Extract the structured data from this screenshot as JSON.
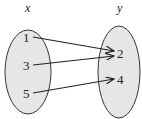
{
  "diagram": {
    "domain_label": "x",
    "range_label": "y",
    "domain": [
      "1",
      "3",
      "5"
    ],
    "range": [
      "2",
      "4"
    ],
    "mappings": [
      {
        "from": "1",
        "to": "2"
      },
      {
        "from": "3",
        "to": "2"
      },
      {
        "from": "5",
        "to": "4"
      }
    ],
    "colors": {
      "oval_fill": "#e6e6e6",
      "stroke": "#222222"
    }
  }
}
